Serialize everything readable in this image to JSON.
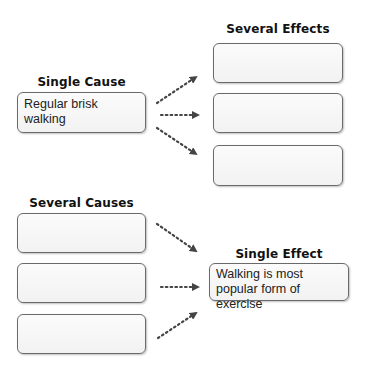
{
  "top_section": {
    "single_cause": {
      "heading": "Single Cause",
      "box_text": "Regular brisk walking"
    },
    "several_effects": {
      "heading": "Several Effects",
      "boxes": [
        "",
        "",
        ""
      ]
    }
  },
  "bottom_section": {
    "several_causes": {
      "heading": "Several Causes",
      "boxes": [
        "",
        "",
        ""
      ]
    },
    "single_effect": {
      "heading": "Single Effect",
      "box_text": "Walking is most popular form of exercise"
    }
  },
  "colors": {
    "box_border": "#6a6a6a",
    "arrow": "#444444",
    "heading_text": "#111111"
  }
}
